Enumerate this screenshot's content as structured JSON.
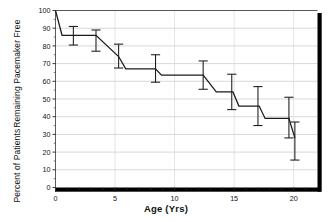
{
  "chart_data": {
    "type": "line",
    "title": "",
    "subtitle": "",
    "xlabel": "Age (Yrs)",
    "ylabel": "Percent of Patients Remaining Pacemaker Free",
    "ylabel_line1": "Percent of Patients",
    "ylabel_line2": "Remaining Pacemaker Free",
    "xlim": [
      0,
      22
    ],
    "ylim": [
      0,
      100
    ],
    "xticks": [
      0,
      5,
      10,
      15,
      20
    ],
    "xtick_labels": [
      "0",
      "5",
      "10",
      "15",
      "20"
    ],
    "yticks": [
      0,
      10,
      20,
      30,
      40,
      50,
      60,
      70,
      80,
      90,
      100
    ],
    "ytick_labels": [
      "0",
      "10",
      "20",
      "30",
      "40",
      "50",
      "60",
      "70",
      "80",
      "90",
      "100"
    ],
    "grid": "horizontal",
    "legend": "none",
    "line_color": "#1a1a1a",
    "grid_color": "#c8c8c8",
    "frame_color": "#000000",
    "series": [
      {
        "name": "Pacemaker-free survival",
        "step_points": [
          {
            "x": 0.0,
            "y": 100
          },
          {
            "x": 0.55,
            "y": 86
          },
          {
            "x": 3.4,
            "y": 86
          },
          {
            "x": 5.3,
            "y": 74
          },
          {
            "x": 5.9,
            "y": 67
          },
          {
            "x": 8.4,
            "y": 67
          },
          {
            "x": 8.9,
            "y": 63.5
          },
          {
            "x": 12.4,
            "y": 63.5
          },
          {
            "x": 13.5,
            "y": 54
          },
          {
            "x": 14.9,
            "y": 54
          },
          {
            "x": 15.4,
            "y": 46
          },
          {
            "x": 17.1,
            "y": 46
          },
          {
            "x": 17.6,
            "y": 39
          },
          {
            "x": 19.6,
            "y": 39
          },
          {
            "x": 20.1,
            "y": 28
          }
        ],
        "error_bars": [
          {
            "x": 1.5,
            "y": 86.0,
            "low": 80.5,
            "high": 91.0
          },
          {
            "x": 3.4,
            "y": 83.0,
            "low": 77.0,
            "high": 89.0
          },
          {
            "x": 5.3,
            "y": 74.0,
            "low": 67.5,
            "high": 81.0
          },
          {
            "x": 8.4,
            "y": 67.0,
            "low": 59.5,
            "high": 75.0
          },
          {
            "x": 12.4,
            "y": 63.5,
            "low": 55.5,
            "high": 71.5
          },
          {
            "x": 14.8,
            "y": 54.0,
            "low": 44.0,
            "high": 64.0
          },
          {
            "x": 17.0,
            "y": 46.0,
            "low": 35.0,
            "high": 57.0
          },
          {
            "x": 19.6,
            "y": 39.0,
            "low": 28.0,
            "high": 51.0
          },
          {
            "x": 20.1,
            "y": 28.0,
            "low": 15.5,
            "high": 37.0
          }
        ]
      }
    ]
  },
  "axes": {
    "x_title": "Age (Yrs)",
    "y_title_line1": "Percent of Patients",
    "y_title_line2": "Remaining Pacemaker Free"
  }
}
